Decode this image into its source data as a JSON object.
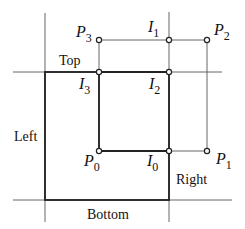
{
  "diagram": {
    "type": "polygon clipping against rectangular window",
    "regions": {
      "top": "Top",
      "left": "Left",
      "right": "Right",
      "bottom": "Bottom"
    },
    "clip_window": {
      "left_x": 45,
      "right_x": 169,
      "top_y": 72,
      "bottom_y": 200
    },
    "polygon_vertices": [
      {
        "name": "P",
        "sub": "0",
        "x": 99,
        "y": 151
      },
      {
        "name": "P",
        "sub": "1",
        "x": 207,
        "y": 151
      },
      {
        "name": "P",
        "sub": "2",
        "x": 207,
        "y": 40
      },
      {
        "name": "P",
        "sub": "3",
        "x": 99,
        "y": 40
      }
    ],
    "intersections": [
      {
        "name": "I",
        "sub": "0",
        "x": 169,
        "y": 151
      },
      {
        "name": "I",
        "sub": "1",
        "x": 169,
        "y": 40
      },
      {
        "name": "I",
        "sub": "2",
        "x": 169,
        "y": 72
      },
      {
        "name": "I",
        "sub": "3",
        "x": 99,
        "y": 72
      }
    ],
    "labels": {
      "p0": {
        "base": "P",
        "sub": "0"
      },
      "p1": {
        "base": "P",
        "sub": "1"
      },
      "p2": {
        "base": "P",
        "sub": "2"
      },
      "p3": {
        "base": "P",
        "sub": "3"
      },
      "i0": {
        "base": "I",
        "sub": "0"
      },
      "i1": {
        "base": "I",
        "sub": "1"
      },
      "i2": {
        "base": "I",
        "sub": "2"
      },
      "i3": {
        "base": "I",
        "sub": "3"
      }
    },
    "colors": {
      "line": "#555555",
      "thick": "#222222",
      "background": "#ffffff"
    }
  }
}
